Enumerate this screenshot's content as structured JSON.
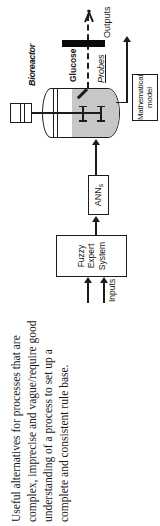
{
  "figure": {
    "caption_lines": [
      "Useful alternatives for processes that are",
      "complex, imprecise and vague/require good",
      "understanding of a process to set up a",
      "complete and consistent rule base."
    ]
  },
  "diagram": {
    "inputs_label": "Inputs",
    "outputs_label": "Outputs",
    "fuzzy_box_lines": [
      "Fuzzy",
      "Expert",
      "System"
    ],
    "ann_box": {
      "base": "ANN",
      "subscript": "s"
    },
    "bioreactor_label": "Bioreactor",
    "glucose_label": "Glucose",
    "probes_label": "Probes",
    "math_model_lines": [
      "Mathematical",
      "model"
    ]
  },
  "colors": {
    "line": "#1c1c1c",
    "liquid": "#c7c7c7",
    "background": "#ffffff",
    "barrier": "#0a0a0a",
    "text": "#161616"
  }
}
